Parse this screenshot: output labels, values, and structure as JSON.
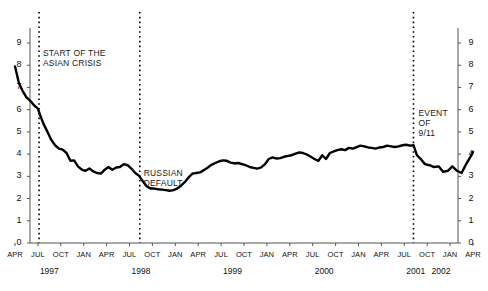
{
  "chart_data": {
    "type": "line",
    "title": "",
    "xlabel": "",
    "ylabel": "",
    "ylim": [
      0,
      9.6
    ],
    "yticks": [
      0,
      1,
      2,
      3,
      4,
      5,
      6,
      7,
      8,
      9
    ],
    "grid": false,
    "legend": null,
    "axis_left_labels": [
      "9",
      "8",
      "7",
      "6",
      "5",
      "4",
      "3",
      "2",
      "1",
      "0"
    ],
    "axis_right_labels": [
      "9",
      "8",
      "7",
      "6",
      "5",
      "4",
      "3",
      "2",
      "1",
      "0"
    ],
    "xtick_labels": [
      "APR",
      "JUL",
      "OCT",
      "JAN",
      "APR",
      "JUL",
      "OCT",
      "JAN",
      "APR",
      "JUL",
      "OCT",
      "JAN",
      "APR",
      "JUL",
      "OCT",
      "JAN",
      "APR",
      "JUL",
      "OCT",
      "JAN",
      "APR"
    ],
    "year_labels": [
      "1997",
      "1998",
      "1999",
      "2000",
      "2001",
      "2002"
    ],
    "annotations": [
      {
        "name": "start-of-asian-crisis",
        "text": "START OF THE\nASIAN CRISIS",
        "x_quarter": 1.0
      },
      {
        "name": "russian-default",
        "text": "RUSSIAN\nDEFAULT",
        "x_quarter": 5.4
      },
      {
        "name": "event-of-911",
        "text": "EVENT\nOF\n9/11",
        "x_quarter": 17.4
      }
    ],
    "event_lines": [
      {
        "name": "asian-crisis-line",
        "x_quarter": 1.05
      },
      {
        "name": "russian-default-line",
        "x_quarter": 5.45
      },
      {
        "name": "event-911-line",
        "x_quarter": 17.4
      }
    ],
    "series": [
      {
        "name": "spread",
        "color": "#000000",
        "x": [
          0.0,
          0.17,
          0.33,
          0.5,
          0.67,
          0.83,
          1.0,
          1.1,
          1.25,
          1.42,
          1.58,
          1.75,
          1.92,
          2.08,
          2.25,
          2.42,
          2.58,
          2.75,
          2.92,
          3.08,
          3.25,
          3.42,
          3.58,
          3.75,
          3.92,
          4.08,
          4.25,
          4.42,
          4.58,
          4.75,
          4.92,
          5.08,
          5.25,
          5.42,
          5.58,
          5.75,
          5.92,
          6.08,
          6.25,
          6.42,
          6.58,
          6.75,
          6.92,
          7.08,
          7.25,
          7.42,
          7.58,
          7.75,
          7.92,
          8.08,
          8.25,
          8.42,
          8.58,
          8.75,
          8.92,
          9.08,
          9.25,
          9.42,
          9.58,
          9.75,
          9.92,
          10.08,
          10.25,
          10.42,
          10.58,
          10.75,
          10.92,
          11.08,
          11.25,
          11.42,
          11.58,
          11.75,
          11.92,
          12.08,
          12.25,
          12.42,
          12.58,
          12.75,
          12.92,
          13.08,
          13.25,
          13.42,
          13.58,
          13.75,
          13.92,
          14.08,
          14.25,
          14.42,
          14.58,
          14.75,
          14.92,
          15.08,
          15.25,
          15.42,
          15.58,
          15.75,
          15.92,
          16.08,
          16.25,
          16.42,
          16.58,
          16.75,
          16.92,
          17.08,
          17.25,
          17.4,
          17.55,
          17.7,
          17.9,
          18.1,
          18.3,
          18.5,
          18.7,
          18.9,
          19.1,
          19.3,
          19.5,
          19.7,
          19.9,
          20.0
        ],
        "y": [
          7.95,
          7.2,
          6.85,
          6.55,
          6.4,
          6.2,
          6.05,
          5.75,
          5.35,
          5.0,
          4.65,
          4.4,
          4.25,
          4.2,
          4.05,
          3.7,
          3.72,
          3.45,
          3.3,
          3.25,
          3.35,
          3.22,
          3.15,
          3.12,
          3.3,
          3.42,
          3.3,
          3.4,
          3.42,
          3.55,
          3.5,
          3.35,
          3.15,
          3.02,
          2.78,
          2.55,
          2.45,
          2.45,
          2.42,
          2.4,
          2.38,
          2.35,
          2.38,
          2.45,
          2.58,
          2.75,
          2.95,
          3.12,
          3.15,
          3.18,
          3.28,
          3.4,
          3.52,
          3.6,
          3.68,
          3.72,
          3.7,
          3.62,
          3.58,
          3.6,
          3.55,
          3.5,
          3.42,
          3.38,
          3.35,
          3.4,
          3.55,
          3.78,
          3.85,
          3.8,
          3.82,
          3.88,
          3.92,
          3.95,
          4.02,
          4.08,
          4.05,
          3.98,
          3.88,
          3.78,
          3.7,
          3.95,
          3.78,
          4.05,
          4.12,
          4.18,
          4.22,
          4.18,
          4.28,
          4.25,
          4.32,
          4.38,
          4.35,
          4.3,
          4.28,
          4.25,
          4.3,
          4.32,
          4.38,
          4.35,
          4.32,
          4.35,
          4.4,
          4.42,
          4.38,
          4.4,
          3.95,
          3.8,
          3.55,
          3.5,
          3.42,
          3.45,
          3.2,
          3.25,
          3.45,
          3.25,
          3.15,
          3.55,
          3.9,
          4.1
        ]
      }
    ]
  }
}
